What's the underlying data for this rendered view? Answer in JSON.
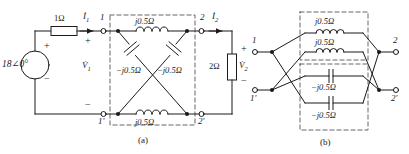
{
  "figure": {
    "stroke_color": "#1a1a1a",
    "dash_color": "#555555",
    "background": "#ffffff"
  },
  "captions": {
    "a": "(a)",
    "b": "(b)"
  },
  "part_a": {
    "source": {
      "label": "18∠0°",
      "plus": "+",
      "minus": "−"
    },
    "series_resistor": {
      "label": "1Ω"
    },
    "load_resistor": {
      "label": "2Ω"
    },
    "currents": {
      "i1": "İ",
      "i1_sub": "1",
      "i2": "İ",
      "i2_sub": "2"
    },
    "voltages": {
      "v1": "V̇",
      "v1_sub": "1",
      "v1_plus": "+",
      "v1_minus": "−",
      "v2": "V̇",
      "v2_sub": "2",
      "v2_plus": "+",
      "v2_minus": "−"
    },
    "terminals": {
      "t1": "1",
      "t1p": "1′",
      "t2": "2",
      "t2p": "2′"
    },
    "elements": {
      "top_inductor": "j0.5Ω",
      "bottom_inductor": "j0.5Ω",
      "left_capacitor": "−j0.5Ω",
      "right_capacitor": "−j0.5Ω"
    }
  },
  "part_b": {
    "terminals": {
      "t1": "1",
      "t1p": "1′",
      "t2": "2",
      "t2p": "2′"
    },
    "elements": {
      "inductor_top": "j0.5Ω",
      "inductor_bottom": "j0.5Ω",
      "capacitor_top": "−j0.5Ω",
      "capacitor_bottom": "−j0.5Ω"
    }
  }
}
